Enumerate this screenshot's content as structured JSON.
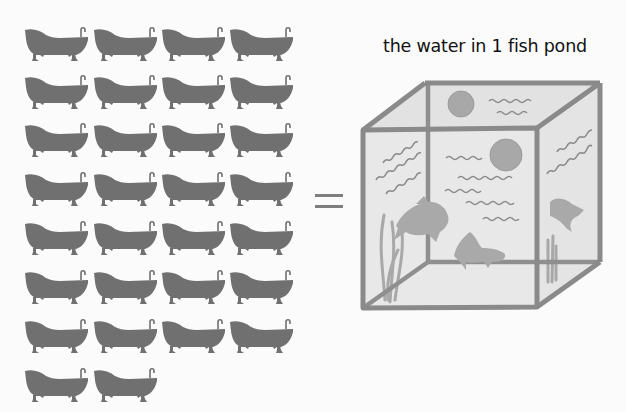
{
  "caption": "the water in 1 fish pond",
  "equation_symbol": "=",
  "tubs": {
    "count": 30,
    "columns": 4,
    "rows": 8,
    "icon": "bathtub-icon",
    "color": "#707070",
    "col_x": [
      24,
      93,
      161,
      229
    ],
    "row_y": [
      25,
      73,
      121,
      170,
      219,
      268,
      317,
      366
    ]
  },
  "tank": {
    "icon": "fish-tank-icon",
    "frame_color": "#8a8a8a",
    "glass_color": "#e6e6e6",
    "fish_color": "#a9a9a9",
    "bubble_color": "#a6a6a6",
    "fish_count": 3,
    "bubble_count": 2
  }
}
